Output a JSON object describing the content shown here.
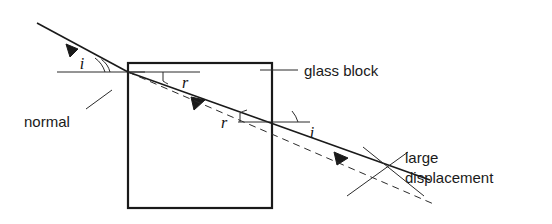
{
  "diagram": {
    "labels": {
      "glass_block": "glass block",
      "normal": "normal",
      "large_displacement_line1": "large",
      "large_displacement_line2": "displacement",
      "angle_incidence_entry": "i",
      "angle_refraction_entry": "r",
      "angle_refraction_exit": "r",
      "angle_incidence_exit": "i"
    },
    "colors": {
      "ink": "#1a1a1a",
      "ink_soft": "#2b2b2b",
      "background": "#ffffff"
    },
    "block": {
      "left": 128,
      "top": 63,
      "right": 272,
      "bottom": 208
    },
    "rays": {
      "incident_start": [
        37,
        23
      ],
      "entry_point": [
        128,
        72
      ],
      "exit_point": [
        268,
        122
      ],
      "emergent_end": [
        430,
        180
      ],
      "dashed_extension_end": [
        436,
        205
      ]
    }
  }
}
